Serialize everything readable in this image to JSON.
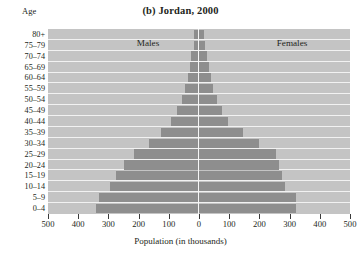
{
  "age_header": "Age",
  "title": "(b) Jordan, 2000",
  "axis": {
    "x_title": "Population (in thousands)",
    "x_ticks": [
      "500",
      "400",
      "300",
      "200",
      "100",
      "0",
      "100",
      "200",
      "300",
      "400",
      "500"
    ]
  },
  "series_labels": {
    "males": "Males",
    "females": "Females"
  },
  "colors": {
    "plot_background": "#c4c4c4",
    "bar": "#8e8e8e",
    "gridline": "#f2f2f2",
    "center_line": "#f6f6f6",
    "text": "#231f20"
  },
  "chart_data": {
    "type": "bar",
    "subtype": "population-pyramid",
    "title": "(b) Jordan, 2000",
    "xlabel": "Population (in thousands)",
    "ylabel": "Age",
    "xlim": [
      -500,
      500
    ],
    "xtick_values": [
      -500,
      -400,
      -300,
      -200,
      -100,
      0,
      100,
      200,
      300,
      400,
      500
    ],
    "xtick_labels": [
      "500",
      "400",
      "300",
      "200",
      "100",
      "0",
      "100",
      "200",
      "300",
      "400",
      "500"
    ],
    "grid": true,
    "legend_position": "in-plot-top",
    "units": "thousands",
    "categories": [
      "80+",
      "75-79",
      "70-74",
      "65-69",
      "60-64",
      "55-59",
      "50-54",
      "45-49",
      "40-44",
      "35-39",
      "30-34",
      "25-29",
      "20-24",
      "15-19",
      "10-14",
      "5-9",
      "0-4"
    ],
    "series": [
      {
        "name": "Males",
        "direction": "left",
        "values": [
          15,
          18,
          25,
          30,
          37,
          47,
          57,
          72,
          93,
          125,
          165,
          215,
          250,
          275,
          295,
          330,
          340
        ]
      },
      {
        "name": "Females",
        "direction": "right",
        "values": [
          15,
          20,
          25,
          32,
          40,
          47,
          60,
          75,
          95,
          145,
          200,
          255,
          265,
          275,
          285,
          320,
          320
        ]
      }
    ]
  }
}
